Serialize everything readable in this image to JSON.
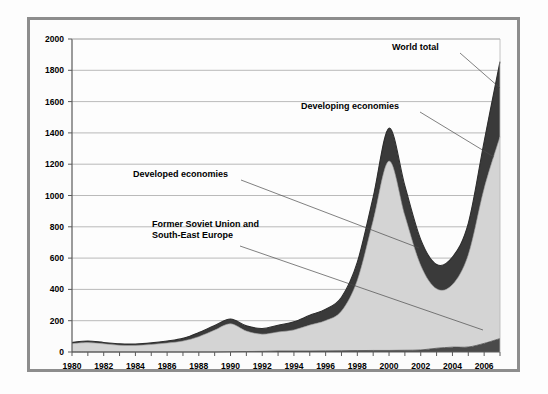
{
  "chart_data": {
    "type": "area",
    "stacked": true,
    "title": "",
    "subtitle": "",
    "xlabel": "",
    "ylabel": "",
    "xlim": [
      1980,
      2007
    ],
    "ylim": [
      0,
      2000
    ],
    "grid": true,
    "legend_position": "annotations-on-plot",
    "y_ticks": [
      0,
      200,
      400,
      600,
      800,
      1000,
      1200,
      1400,
      1600,
      1800,
      2000
    ],
    "y_tick_labels": [
      "0",
      "200",
      "400",
      "600",
      "800",
      "1000",
      "1200",
      "1400",
      "1600",
      "1800",
      "2000"
    ],
    "x_ticks": [
      1980,
      1981,
      1982,
      1983,
      1984,
      1985,
      1986,
      1987,
      1988,
      1989,
      1990,
      1991,
      1992,
      1993,
      1994,
      1995,
      1996,
      1997,
      1998,
      1999,
      2000,
      2001,
      2002,
      2003,
      2004,
      2005,
      2006,
      2007
    ],
    "x_tick_labels": [
      "1980",
      "1982",
      "1984",
      "1986",
      "1988",
      "1990",
      "1992",
      "1994",
      "1996",
      "1998",
      "2000",
      "2002",
      "2004",
      "2006"
    ],
    "x_labeled_ticks": [
      1980,
      1982,
      1984,
      1986,
      1988,
      1990,
      1992,
      1994,
      1996,
      1998,
      2000,
      2002,
      2004,
      2006
    ],
    "x": [
      1980,
      1981,
      1982,
      1983,
      1984,
      1985,
      1986,
      1987,
      1988,
      1989,
      1990,
      1991,
      1992,
      1993,
      1994,
      1995,
      1996,
      1997,
      1998,
      1999,
      2000,
      2001,
      2002,
      2003,
      2004,
      2005,
      2006,
      2007
    ],
    "series": [
      {
        "name": "Former Soviet Union and South-East Europe",
        "color": "#4a4a4a",
        "values": [
          0,
          0,
          0,
          0,
          0,
          0,
          0,
          0,
          0,
          0,
          2,
          3,
          4,
          6,
          6,
          6,
          7,
          8,
          9,
          10,
          10,
          11,
          13,
          24,
          31,
          32,
          55,
          86
        ]
      },
      {
        "name": "Developed economies",
        "color": "#d4d4d4",
        "values": [
          53,
          60,
          52,
          43,
          42,
          48,
          57,
          70,
          98,
          140,
          178,
          131,
          110,
          122,
          135,
          166,
          194,
          254,
          450,
          830,
          1210,
          860,
          540,
          380,
          400,
          590,
          990,
          1290
        ]
      },
      {
        "name": "Developing economies",
        "color": "#3a3a3a",
        "values": [
          8,
          10,
          9,
          9,
          9,
          10,
          13,
          17,
          26,
          30,
          31,
          33,
          36,
          43,
          52,
          63,
          72,
          88,
          115,
          150,
          210,
          190,
          165,
          155,
          175,
          200,
          300,
          480
        ]
      }
    ],
    "totals": {
      "name": "World total",
      "values": [
        61,
        70,
        61,
        52,
        51,
        58,
        70,
        87,
        124,
        170,
        211,
        167,
        150,
        171,
        193,
        235,
        273,
        350,
        574,
        990,
        1430,
        1061,
        718,
        559,
        606,
        822,
        1345,
        1856
      ]
    },
    "annotations": [
      {
        "id": "world-total",
        "text": "World total",
        "text_x": 392,
        "text_y": 50,
        "leader": [
          [
            460,
            53
          ],
          [
            500,
            88
          ]
        ]
      },
      {
        "id": "developing-economies",
        "text": "Developing economies",
        "text_x": 301,
        "text_y": 109,
        "leader": [
          [
            420,
            112
          ],
          [
            494,
            157
          ]
        ]
      },
      {
        "id": "developed-economies",
        "text": "Developed economies",
        "text_x": 133,
        "text_y": 177,
        "leader": [
          [
            241,
            180
          ],
          [
            419,
            248
          ]
        ]
      },
      {
        "id": "former-soviet-union",
        "text_line1": "Former Soviet Union and",
        "text_line2": "South-East Europe",
        "text_x": 152,
        "text_y": 227,
        "leader": [
          [
            240,
            246
          ],
          [
            483,
            330
          ]
        ]
      }
    ],
    "colors": {
      "developed_band": "#d4d4d4",
      "developing_band": "#3a3a3a",
      "fsu_band": "#4a4a4a",
      "gridline": "#a8a8a8",
      "axis": "#5a5a5a",
      "frame_border": "#8d8d8d",
      "background": "#fcfcfc",
      "text": "#000000"
    },
    "plot_area": {
      "left": 72,
      "right": 500,
      "top": 39,
      "bottom": 352
    }
  }
}
